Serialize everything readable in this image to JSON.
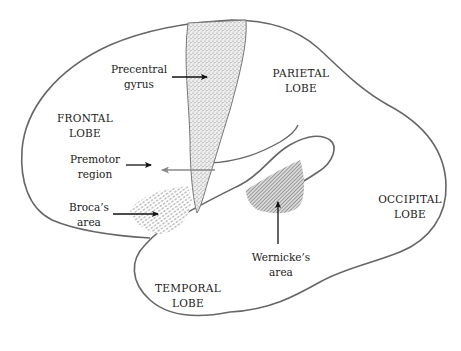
{
  "diagram": {
    "type": "brain-lateral-view",
    "colors": {
      "outline": "#666666",
      "text": "#1a1a1a",
      "stipple": "#888888",
      "hatch": "#777777",
      "background": "#ffffff"
    },
    "lobes": {
      "frontal": {
        "line1": "FRONTAL",
        "line2": "LOBE"
      },
      "parietal": {
        "line1": "PARIETAL",
        "line2": "LOBE"
      },
      "occipital": {
        "line1": "OCCIPITAL",
        "line2": "LOBE"
      },
      "temporal": {
        "line1": "TEMPORAL",
        "line2": "LOBE"
      }
    },
    "regions": {
      "precentral": {
        "line1": "Precentral",
        "line2": "gyrus"
      },
      "premotor": {
        "line1": "Premotor",
        "line2": "region"
      },
      "broca": {
        "line1": "Broca’s",
        "line2": "area"
      },
      "wernicke": {
        "line1": "Wernicke’s",
        "line2": "area"
      }
    }
  }
}
